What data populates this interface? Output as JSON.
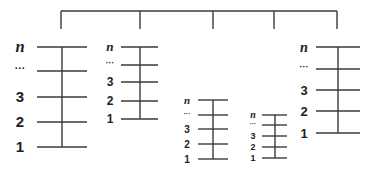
{
  "diagram": {
    "line_color": "#3a3a3a",
    "label_color": "#222222",
    "connector": {
      "branches": 5
    },
    "ladders": [
      {
        "id": "ladder-1",
        "labels": [
          "1",
          "2",
          "3",
          "...",
          "n"
        ]
      },
      {
        "id": "ladder-2",
        "labels": [
          "1",
          "2",
          "3",
          "...",
          "n"
        ]
      },
      {
        "id": "ladder-3",
        "labels": [
          "1",
          "2",
          "3",
          "...",
          "n"
        ]
      },
      {
        "id": "ladder-4",
        "labels": [
          "1",
          "2",
          "3",
          "...",
          "n"
        ]
      },
      {
        "id": "ladder-5",
        "labels": [
          "1",
          "2",
          "3",
          "...",
          "n"
        ]
      }
    ]
  }
}
